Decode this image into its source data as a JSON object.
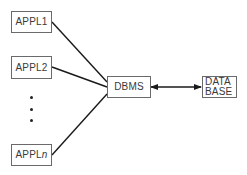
{
  "diagram": {
    "applications": [
      {
        "label": "APPL",
        "suffix": "1",
        "suffix_italic": false
      },
      {
        "label": "APPL",
        "suffix": "2",
        "suffix_italic": false
      },
      {
        "label": "APPL",
        "suffix": "n",
        "suffix_italic": true
      }
    ],
    "ellipsis": "⋮",
    "dbms": {
      "label": "DBMS"
    },
    "database": {
      "line1": "DATA",
      "line2": "BASE"
    },
    "connections": [
      {
        "from": "APPL1",
        "to": "DBMS",
        "type": "line"
      },
      {
        "from": "APPL2",
        "to": "DBMS",
        "type": "line"
      },
      {
        "from": "APPLn",
        "to": "DBMS",
        "type": "line"
      },
      {
        "from": "DBMS",
        "to": "DATA BASE",
        "type": "bidirectional-arrow"
      }
    ],
    "colors": {
      "line": "#1a1a1a",
      "box_border": "#6a6a6a",
      "text": "#3a3a3a"
    }
  }
}
